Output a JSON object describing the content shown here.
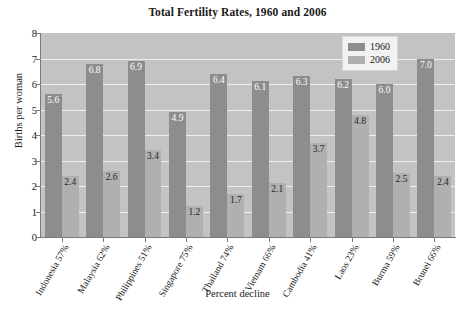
{
  "chart_data": {
    "type": "bar",
    "title": "Total Fertility Rates, 1960 and 2006",
    "xlabel": "Percent decline",
    "ylabel": "Births per woman",
    "ylim": [
      0,
      8
    ],
    "yticks": [
      "0",
      "1",
      "2",
      "3",
      "4",
      "5",
      "6",
      "7",
      "8"
    ],
    "grid": true,
    "legend_position": "top-right",
    "categories": [
      "Indonesia",
      "Malaysia",
      "Philippines",
      "Singapore",
      "Thailand",
      "Vietnam",
      "Cambodia",
      "Laos",
      "Burma",
      "Brunei"
    ],
    "percent_decline": [
      "57%",
      "62%",
      "51%",
      "75%",
      "74%",
      "66%",
      "41%",
      "23%",
      "59%",
      "66%"
    ],
    "tick_labels": [
      "Indonesia  57%",
      "Malaysia  62%",
      "Philippines  51%",
      "Singapore  75%",
      "Thailand  74%",
      "Vietnam  66%",
      "Cambodia  41%",
      "Laos  23%",
      "Burma  59%",
      "Brunei  66%"
    ],
    "series": [
      {
        "name": "1960",
        "color": "#8d8d8d",
        "values": [
          5.6,
          6.8,
          6.9,
          4.9,
          6.4,
          6.1,
          6.3,
          6.2,
          6.0,
          7.0
        ],
        "labels": [
          "5.6",
          "6.8",
          "6.9",
          "4.9",
          "6.4",
          "6.1",
          "6.3",
          "6.2",
          "6.0",
          "7.0"
        ]
      },
      {
        "name": "2006",
        "color": "#b0b0b0",
        "values": [
          2.4,
          2.6,
          3.4,
          1.2,
          1.7,
          2.1,
          3.7,
          4.8,
          2.5,
          2.4
        ],
        "labels": [
          "2.4",
          "2.6",
          "3.4",
          "1.2",
          "1.7",
          "2.1",
          "3.7",
          "4.8",
          "2.5",
          "2.4"
        ]
      }
    ]
  },
  "legend": {
    "entries": [
      {
        "label": "1960"
      },
      {
        "label": "2006"
      }
    ]
  }
}
